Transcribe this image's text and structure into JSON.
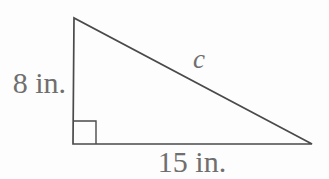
{
  "figure": {
    "type": "right-triangle-diagram",
    "labels": {
      "vertical_leg": "8 in.",
      "horizontal_leg": "15 in.",
      "hypotenuse": "c"
    },
    "right_angle_marker": "bottom-left vertex",
    "colors": {
      "line": "#4a4a4a",
      "text": "#6f6f6f",
      "background": "#fdfdfd"
    }
  }
}
